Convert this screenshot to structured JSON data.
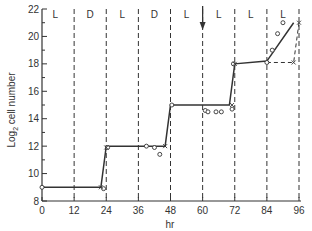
{
  "chart_data": {
    "type": "line",
    "title": "",
    "xlabel": "hr",
    "ylabel": "Log2 cell number",
    "ylabel_main": "Log",
    "ylabel_sub": "2",
    "ylabel_rest": " cell number",
    "xlim": [
      0,
      96
    ],
    "ylim": [
      8,
      22
    ],
    "x_ticks": [
      0,
      12,
      24,
      36,
      48,
      60,
      72,
      84,
      96
    ],
    "x_tick_labels": [
      "0",
      "12",
      "24",
      "36",
      "48",
      "60",
      "72",
      "84",
      "96"
    ],
    "y_ticks": [
      8,
      10,
      12,
      14,
      16,
      18,
      20,
      22
    ],
    "y_tick_labels": [
      "8",
      "10",
      "12",
      "14",
      "16",
      "18",
      "20",
      "22"
    ],
    "grid": false,
    "period_boundaries_hr": [
      12,
      24,
      36,
      48,
      60,
      72,
      84,
      96
    ],
    "period_labels": [
      {
        "x": 5,
        "label": "L"
      },
      {
        "x": 18,
        "label": "D"
      },
      {
        "x": 30,
        "label": "L"
      },
      {
        "x": 42,
        "label": "D"
      },
      {
        "x": 54,
        "label": "L"
      },
      {
        "x": 66,
        "label": "L"
      },
      {
        "x": 78,
        "label": "L"
      },
      {
        "x": 90,
        "label": "L"
      }
    ],
    "annotations": [
      {
        "type": "arrow-down",
        "x": 60,
        "label": "transfer to continuous light"
      }
    ],
    "series": [
      {
        "name": "step-growth-curve",
        "style": "solid",
        "x": [
          0,
          22,
          24,
          46,
          48,
          70,
          72,
          84,
          94
        ],
        "y": [
          9,
          9,
          12,
          12,
          15,
          15,
          18,
          18.2,
          21
        ]
      },
      {
        "name": "alternate-curve",
        "style": "dashed",
        "x": [
          84,
          94,
          96
        ],
        "y": [
          18.1,
          18.1,
          21
        ]
      },
      {
        "name": "circles",
        "style": "marker-circle",
        "x": [
          0,
          23,
          24.5,
          39,
          42,
          44,
          48.5,
          61,
          62,
          65,
          67,
          71,
          71.5,
          84,
          86,
          88,
          90
        ],
        "y": [
          9,
          8.9,
          11.9,
          12,
          11.9,
          11.4,
          15,
          14.6,
          14.5,
          14.5,
          14.5,
          14.7,
          18,
          18.1,
          19,
          20.2,
          21
        ]
      },
      {
        "name": "crosses",
        "style": "marker-x",
        "x": [
          22,
          24,
          46,
          71,
          72,
          94,
          96
        ],
        "y": [
          9,
          11.9,
          12,
          15,
          18,
          18.1,
          21
        ]
      }
    ]
  }
}
